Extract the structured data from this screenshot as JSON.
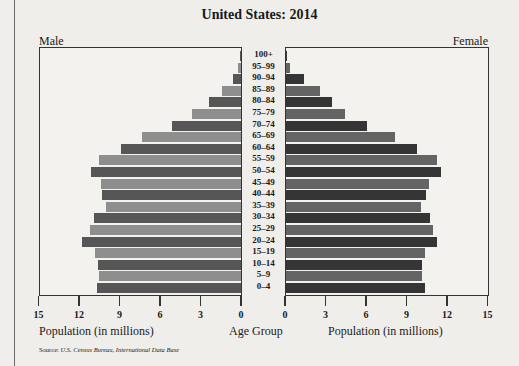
{
  "chart_data": {
    "type": "bar",
    "orientation": "horizontal-population-pyramid",
    "title": "United States: 2014",
    "left_label": "Male",
    "right_label": "Female",
    "xlabel_left": "Population (in millions)",
    "xlabel_right": "Population (in millions)",
    "center_label": "Age Group",
    "xlim": [
      0,
      15
    ],
    "xticks": [
      0,
      3,
      6,
      9,
      12,
      15
    ],
    "categories": [
      "100+",
      "95–99",
      "90–94",
      "85–89",
      "80–84",
      "75–79",
      "70–74",
      "65–69",
      "60–64",
      "55–59",
      "50–54",
      "45–49",
      "40–44",
      "35–39",
      "30–34",
      "25–29",
      "20–24",
      "15–19",
      "10–14",
      "5–9",
      "0–4"
    ],
    "series": [
      {
        "name": "Male",
        "values": [
          0.05,
          0.2,
          0.6,
          1.4,
          2.4,
          3.6,
          5.1,
          7.3,
          8.9,
          10.5,
          11.1,
          10.4,
          10.3,
          10.0,
          10.9,
          11.2,
          11.8,
          10.8,
          10.6,
          10.5,
          10.7
        ]
      },
      {
        "name": "Female",
        "values": [
          0.1,
          0.3,
          1.3,
          2.5,
          3.4,
          4.4,
          6.0,
          8.1,
          9.7,
          11.2,
          11.5,
          10.6,
          10.4,
          10.0,
          10.7,
          10.9,
          11.2,
          10.3,
          10.1,
          10.1,
          10.3
        ]
      }
    ],
    "grid": false,
    "source": "Source: U.S. Census Bureau, International Data Base"
  },
  "colors": {
    "male_dark": "#565656",
    "male_light": "#8e8e8e",
    "female_dark": "#353535",
    "female_light": "#646464"
  },
  "source_prefix": "Source: ",
  "source_italic": "U.S. Census Bureau, International Data Base"
}
